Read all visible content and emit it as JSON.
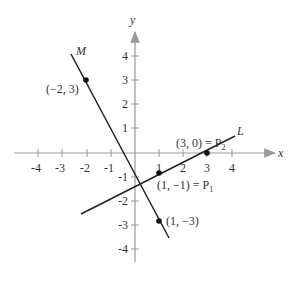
{
  "diagram": {
    "axes": {
      "x_label": "x",
      "y_label": "y",
      "x_ticks": [
        "-4",
        "-3",
        "-2",
        "-1",
        "1",
        "2",
        "3",
        "4"
      ],
      "y_ticks": [
        "4",
        "3",
        "2",
        "1",
        "-1",
        "-2",
        "-3",
        "-4"
      ],
      "axis_color": "#9a9a9a"
    },
    "lines": [
      {
        "name": "M",
        "label": "M",
        "color": "#222222"
      },
      {
        "name": "L",
        "label": "L",
        "color": "#222222"
      }
    ],
    "points": [
      {
        "label": "(−2, 3)",
        "x": -2,
        "y": 3
      },
      {
        "label": "(3, 0) = P",
        "sub": "2",
        "x": 3,
        "y": 0
      },
      {
        "label": "(1, −1) = P",
        "sub": "1",
        "x": 1,
        "y": -1
      },
      {
        "label": "(1, −3)",
        "x": 1,
        "y": -3
      }
    ]
  }
}
